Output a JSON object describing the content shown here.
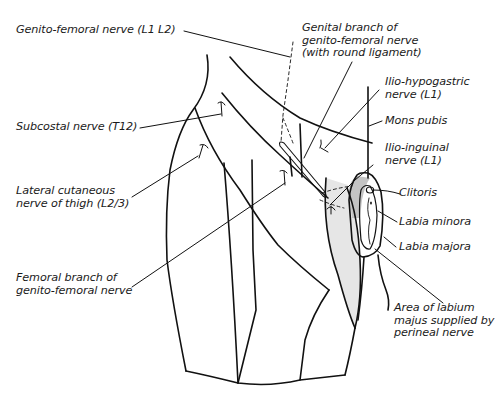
{
  "diagram": {
    "colors": {
      "outline": "#111111",
      "shade_dark": "#c4c4c4",
      "shade_light": "#e6e6e6",
      "text": "#1a1a1a"
    },
    "labels": {
      "genito_femoral": "Genito-femoral nerve (L1 L2)",
      "genital_branch_1": "Genital branch of",
      "genital_branch_2": "genito-femoral nerve",
      "genital_branch_3": "(with round ligament)",
      "ilio_hypogastric_1": "Ilio-hypogastric",
      "ilio_hypogastric_2": "nerve (L1)",
      "mons_pubis": "Mons pubis",
      "ilio_inguinal_1": "Ilio-inguinal",
      "ilio_inguinal_2": "nerve (L1)",
      "clitoris": "Clitoris",
      "labia_minora": "Labia minora",
      "labia_majora": "Labia majora",
      "subcostal": "Subcostal nerve (T12)",
      "lateral_cutaneous_1": "Lateral cutaneous",
      "lateral_cutaneous_2": "nerve of thigh (L2/3)",
      "femoral_branch_1": "Femoral branch of",
      "femoral_branch_2": "genito-femoral nerve",
      "perineal_area_1": "Area of labium",
      "perineal_area_2": "majus supplied by",
      "perineal_area_3": "perineal nerve"
    }
  }
}
